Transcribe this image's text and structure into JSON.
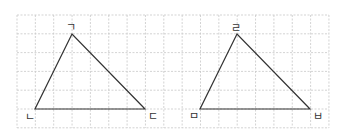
{
  "diagram": {
    "type": "two triangles on a square grid",
    "grid": {
      "x0": 17,
      "y0": 15,
      "cols": 17,
      "rows": 6,
      "cell_w": 18.35,
      "cell_h": 18.8,
      "color": "#c8c8c8",
      "style": "dashed"
    },
    "triangles": [
      {
        "id": "left",
        "vertices": [
          {
            "label": "ㄱ",
            "x": 72,
            "y": 34,
            "lx": 66,
            "ly": 31
          },
          {
            "label": "ㄴ",
            "x": 35,
            "y": 109,
            "lx": 25,
            "ly": 121
          },
          {
            "label": "ㄷ",
            "x": 145,
            "y": 109,
            "lx": 148,
            "ly": 120
          }
        ]
      },
      {
        "id": "right",
        "vertices": [
          {
            "label": "ㄹ",
            "x": 237,
            "y": 34,
            "lx": 231,
            "ly": 32
          },
          {
            "label": "ㅁ",
            "x": 200,
            "y": 109,
            "lx": 189,
            "ly": 120
          },
          {
            "label": "ㅂ",
            "x": 310,
            "y": 109,
            "lx": 313,
            "ly": 120
          }
        ]
      }
    ]
  }
}
